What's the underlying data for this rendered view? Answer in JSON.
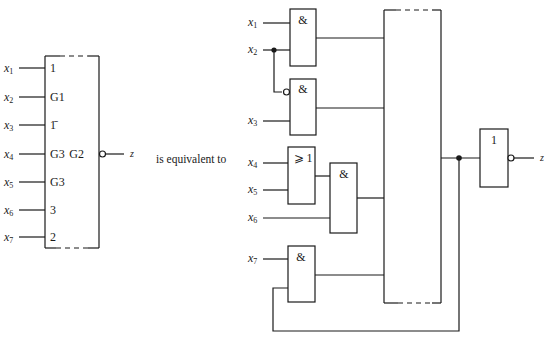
{
  "left_symbol": {
    "inputs": [
      {
        "var": "x",
        "sub": "1",
        "label": "1"
      },
      {
        "var": "x",
        "sub": "2",
        "label": "G1"
      },
      {
        "var": "x",
        "sub": "3",
        "label": "1̄"
      },
      {
        "var": "x",
        "sub": "4",
        "label": "G3"
      },
      {
        "var": "x",
        "sub": "5",
        "label": "G3"
      },
      {
        "var": "x",
        "sub": "6",
        "label": "3"
      },
      {
        "var": "x",
        "sub": "7",
        "label": "2"
      }
    ],
    "output_label": "G2",
    "output_var": "z"
  },
  "middle_text": "is equivalent to",
  "right_circuit": {
    "inputs": [
      {
        "var": "x",
        "sub": "1"
      },
      {
        "var": "x",
        "sub": "2"
      },
      {
        "var": "x",
        "sub": "3"
      },
      {
        "var": "x",
        "sub": "4"
      },
      {
        "var": "x",
        "sub": "5"
      },
      {
        "var": "x",
        "sub": "6"
      },
      {
        "var": "x",
        "sub": "7"
      }
    ],
    "gates": [
      {
        "id": "and1",
        "symbol": "&"
      },
      {
        "id": "and2",
        "symbol": "&"
      },
      {
        "id": "or1",
        "symbol": "⩾ 1"
      },
      {
        "id": "and3",
        "symbol": "&"
      },
      {
        "id": "and4",
        "symbol": "&"
      },
      {
        "id": "not1",
        "symbol": "1"
      }
    ],
    "output_var": "z"
  }
}
